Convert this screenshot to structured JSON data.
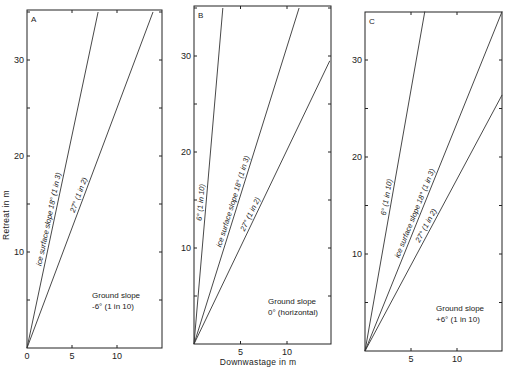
{
  "chart_data": [
    {
      "type": "line",
      "panel": "A",
      "title": "A",
      "xlabel": "",
      "ylabel": "Retreat in m",
      "xlim": [
        0,
        15
      ],
      "ylim": [
        0,
        35
      ],
      "xticks": [
        0,
        5,
        10
      ],
      "yticks": [
        10,
        20,
        30
      ],
      "annotation": [
        "Ground slope",
        "-6° (1 in 10)"
      ],
      "series": [
        {
          "name": "ice surface slope 18° (1 in 3)",
          "x": [
            0,
            7.9
          ],
          "y": [
            0,
            35
          ]
        },
        {
          "name": "27° (1 in 2)",
          "x": [
            0,
            14.0
          ],
          "y": [
            0,
            35
          ]
        }
      ]
    },
    {
      "type": "line",
      "panel": "B",
      "title": "B",
      "xlabel": "Downwastage in m",
      "ylabel": "",
      "xlim": [
        0,
        15
      ],
      "ylim": [
        0,
        35
      ],
      "xticks": [
        5,
        10
      ],
      "yticks": [
        10,
        20,
        30
      ],
      "annotation": [
        "Ground slope",
        "0° (horizontal)"
      ],
      "series": [
        {
          "name": "6° (1 in 10)",
          "x": [
            0,
            3.1
          ],
          "y": [
            0,
            35
          ]
        },
        {
          "name": "ice surface slope 18° (1 in 3)",
          "x": [
            0,
            11.3
          ],
          "y": [
            0,
            35
          ]
        },
        {
          "name": "27° (1 in 2)",
          "x": [
            0,
            14.6
          ],
          "y": [
            0,
            29.5
          ]
        }
      ]
    },
    {
      "type": "line",
      "panel": "C",
      "title": "C",
      "xlabel": "",
      "ylabel": "",
      "xlim": [
        0,
        15
      ],
      "ylim": [
        0,
        35
      ],
      "xticks": [
        5,
        10
      ],
      "yticks": [
        10,
        20,
        30
      ],
      "annotation": [
        "Ground slope",
        "+6° (1 in 10)"
      ],
      "series": [
        {
          "name": "6° (1 in 10)",
          "x": [
            0,
            6.5
          ],
          "y": [
            0,
            35
          ]
        },
        {
          "name": "ice surface slope 18° (1 in 3)",
          "x": [
            0,
            14.9
          ],
          "y": [
            0,
            35
          ]
        },
        {
          "name": "27° (1 in 2)",
          "x": [
            0,
            14.9
          ],
          "y": [
            0,
            26.4
          ]
        }
      ]
    }
  ],
  "layout": {
    "panels": [
      {
        "x0": 27,
        "y0": 348,
        "x1": 162,
        "ytop": 10,
        "sx": 9.0,
        "sy": 9.6,
        "labelPos": [
          {
            "t": 0.38,
            "off": -3
          },
          {
            "t": 0.45,
            "off": -3
          }
        ],
        "notePos": [
          92,
          298
        ]
      },
      {
        "x0": 194,
        "y0": 344,
        "x1": 331,
        "ytop": 6,
        "sx": 9.3,
        "sy": 9.6,
        "labelPos": [
          {
            "t": 0.42,
            "off": -3
          },
          {
            "t": 0.42,
            "off": -3
          },
          {
            "t": 0.45,
            "off": -3
          }
        ],
        "notePos": [
          268,
          304
        ]
      },
      {
        "x0": 365,
        "y0": 351,
        "x1": 502,
        "ytop": 12,
        "sx": 9.2,
        "sy": 9.7,
        "labelPos": [
          {
            "t": 0.45,
            "off": -3
          },
          {
            "t": 0.4,
            "off": -3
          },
          {
            "t": 0.48,
            "off": -3
          }
        ],
        "notePos": [
          436,
          311
        ]
      }
    ]
  },
  "labels": {
    "ylabel": "Retreat in m",
    "xlabel": "Downwastage in m"
  }
}
